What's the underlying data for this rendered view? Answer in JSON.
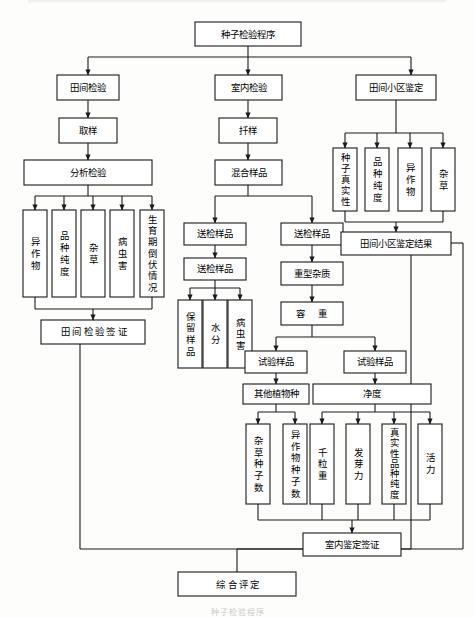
{
  "figure": {
    "title": "种子检验程序",
    "caption": "种子检验程序",
    "type": "flowchart",
    "width": 475,
    "height": 618,
    "line_color": "#1a1a1a",
    "box_fill": "#ffffff",
    "background": "#fdfdfc"
  },
  "nodes": {
    "root": "种子检验程序",
    "field_inspection": "田间检验",
    "indoor_inspection": "室内检验",
    "field_plot_id": "田间小区鉴定",
    "sampling": "取样",
    "stir_sample": "扦样",
    "analysis_inspection": "分析检验",
    "mixed_sample": "混合样品",
    "left_items": [
      "异作物",
      "品种纯度",
      "杂草",
      "病虫害",
      "生育期倒伏情况"
    ],
    "field_cert": "田间检验签证",
    "submit_sample_1": "送检样品",
    "submit_sample_2": "送检样品",
    "submit_sample_3": "送检样品",
    "retained_sample": "保留样品",
    "moisture": "水分",
    "pest_disease": "病虫害",
    "heavy_impurity": "重型杂质",
    "bulk_weight": "容  重",
    "plot_items": [
      "种子真实性",
      "品种纯度",
      "异作物",
      "杂草"
    ],
    "plot_result": "田间小区鉴定结果",
    "test_sample_left": "试验样品",
    "test_sample_right": "试验样品",
    "other_plant_species": "其他植物种",
    "purity": "净度",
    "weed_seed_count": "杂草种子数",
    "other_crop_seed_count": "异作物种子数",
    "thousand_grain_weight": "千粒重",
    "germination": "发芽力",
    "authenticity_purity": "真实性品种纯度",
    "vigor": "活力",
    "indoor_cert": "室内鉴定签证",
    "overall_assessment": "综合评定"
  }
}
